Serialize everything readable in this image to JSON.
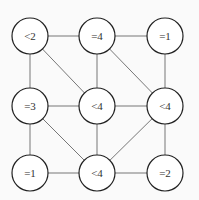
{
  "diagram": {
    "type": "grid-graph",
    "nodes": [
      {
        "id": "n00",
        "label": "<2",
        "x": 30,
        "y": 36
      },
      {
        "id": "n10",
        "label": "=4",
        "x": 97,
        "y": 36
      },
      {
        "id": "n20",
        "label": "=1",
        "x": 165,
        "y": 36
      },
      {
        "id": "n01",
        "label": "=3",
        "x": 30,
        "y": 106
      },
      {
        "id": "n11",
        "label": "<4",
        "x": 97,
        "y": 106
      },
      {
        "id": "n21",
        "label": "<4",
        "x": 165,
        "y": 106
      },
      {
        "id": "n02",
        "label": "=1",
        "x": 30,
        "y": 173
      },
      {
        "id": "n12",
        "label": "<4",
        "x": 97,
        "y": 173
      },
      {
        "id": "n22",
        "label": "=2",
        "x": 165,
        "y": 173
      }
    ],
    "edges": [
      [
        "n00",
        "n10"
      ],
      [
        "n10",
        "n20"
      ],
      [
        "n01",
        "n11"
      ],
      [
        "n11",
        "n21"
      ],
      [
        "n02",
        "n12"
      ],
      [
        "n12",
        "n22"
      ],
      [
        "n00",
        "n01"
      ],
      [
        "n01",
        "n02"
      ],
      [
        "n10",
        "n11"
      ],
      [
        "n11",
        "n12"
      ],
      [
        "n20",
        "n21"
      ],
      [
        "n21",
        "n22"
      ],
      [
        "n00",
        "n11"
      ],
      [
        "n10",
        "n21"
      ],
      [
        "n01",
        "n12"
      ],
      [
        "n21",
        "n12"
      ]
    ],
    "node_radius": 18
  }
}
